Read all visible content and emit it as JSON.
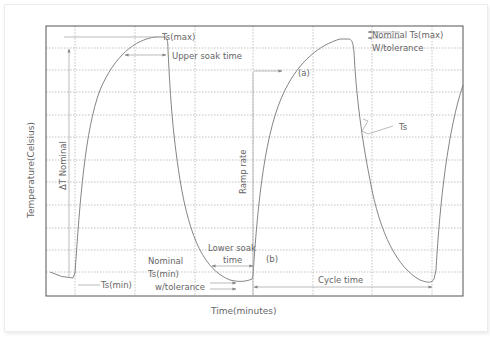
{
  "diagram": {
    "type": "thermal-cycle-profile",
    "axes": {
      "x_label": "Time(minutes)",
      "y_label": "Temperature(Celsius)"
    },
    "labels": {
      "ts_max": "Ts(max)",
      "upper_soak_time": "Upper soak time",
      "nominal_ts_max_line1": "Nominal Ts(max)",
      "nominal_ts_max_line2": "W/tolerance",
      "point_a": "(a)",
      "ts": "Ts",
      "delta_t_nominal": "ΔT Nominal",
      "ramp_rate": "Ramp rate",
      "ts_min": "Ts(min)",
      "nominal_ts_min_line1": "Nominal",
      "nominal_ts_min_line2": "Ts(min)",
      "nominal_ts_min_line3": "w/tolerance",
      "lower_soak_line1": "Lower soak",
      "lower_soak_line2": "time",
      "point_b": "(b)",
      "cycle_time": "Cycle time"
    },
    "grid": {
      "frame": {
        "left": 46,
        "top": 26,
        "right": 463,
        "bottom": 296
      },
      "vertical_x": [
        75,
        135,
        195,
        253,
        313,
        372,
        432
      ],
      "horizontal_y": [
        48,
        70,
        92,
        115,
        137,
        160,
        182,
        205,
        228,
        250,
        272
      ]
    },
    "colors": {
      "curve": "#777777",
      "grid": "#9a9a9a",
      "frame": "#555555",
      "text": "#666666"
    }
  }
}
